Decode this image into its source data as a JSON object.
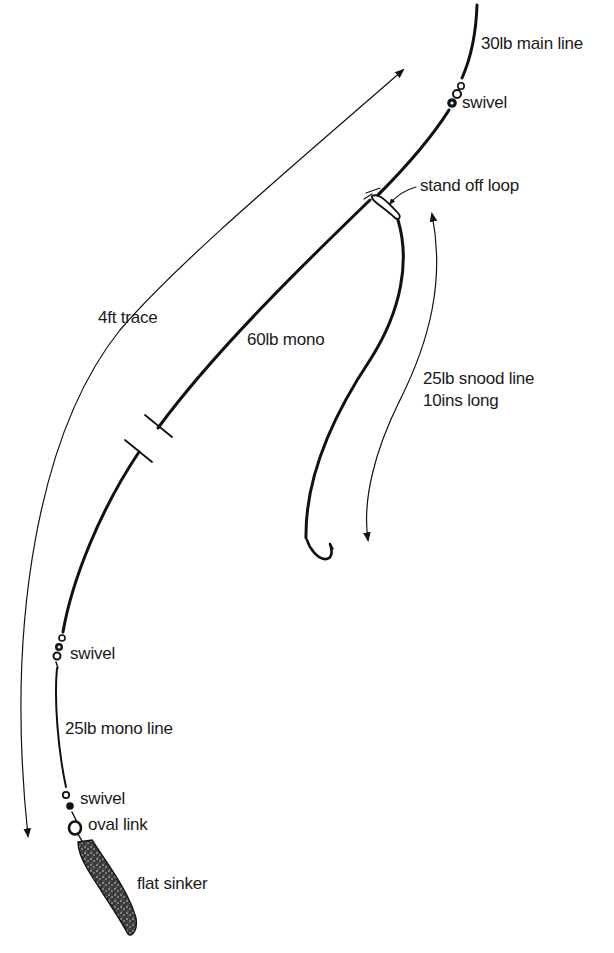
{
  "diagram": {
    "labels": {
      "main_line": "30lb main line",
      "top_swivel": "swivel",
      "stand_off_loop": "stand off loop",
      "trace": "4ft trace",
      "mono_60": "60lb mono",
      "snood_line_1": "25lb snood line",
      "snood_line_2": "10ins long",
      "lower_swivel": "swivel",
      "mono_25": "25lb mono line",
      "bottom_swivel": "swivel",
      "oval_link": "oval link",
      "sinker": "flat sinker"
    },
    "components": [
      {
        "id": "main-line",
        "label": "30lb main line"
      },
      {
        "id": "top-swivel",
        "label": "swivel"
      },
      {
        "id": "stand-off-loop",
        "label": "stand off loop"
      },
      {
        "id": "trace-60lb",
        "label": "60lb mono",
        "length": "4ft trace"
      },
      {
        "id": "snood",
        "label": "25lb snood line",
        "length": "10ins long"
      },
      {
        "id": "hook",
        "label": ""
      },
      {
        "id": "lower-swivel",
        "label": "swivel"
      },
      {
        "id": "mono-25lb",
        "label": "25lb mono line"
      },
      {
        "id": "bottom-swivel",
        "label": "swivel"
      },
      {
        "id": "oval-link",
        "label": "oval link"
      },
      {
        "id": "flat-sinker",
        "label": "flat sinker"
      }
    ],
    "colors": {
      "ink": "#111111",
      "background": "#ffffff"
    }
  }
}
